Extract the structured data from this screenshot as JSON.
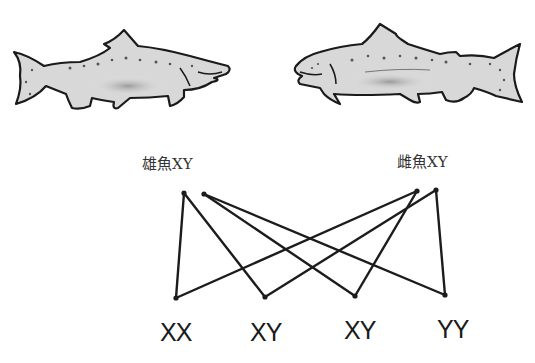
{
  "parents": {
    "male": {
      "label": "雄魚XY",
      "x": 142,
      "y": 152
    },
    "female": {
      "label": "雌魚XY",
      "x": 397,
      "y": 150
    }
  },
  "offspring": [
    {
      "label": "XX",
      "x": 160,
      "y": 318
    },
    {
      "label": "XY",
      "x": 250,
      "y": 318
    },
    {
      "label": "XY",
      "x": 344,
      "y": 316
    },
    {
      "label": "YY",
      "x": 437,
      "y": 315
    }
  ],
  "gamete_points": {
    "male_1": [
      184,
      193
    ],
    "male_2": [
      204,
      194
    ],
    "female_1": [
      417,
      191
    ],
    "female_2": [
      436,
      190
    ]
  },
  "offspring_points": [
    [
      176,
      298
    ],
    [
      265,
      297
    ],
    [
      355,
      296
    ],
    [
      445,
      295
    ]
  ],
  "cross_lines": [
    {
      "from": "male_1",
      "to": 0
    },
    {
      "from": "male_1",
      "to": 1
    },
    {
      "from": "male_2",
      "to": 2
    },
    {
      "from": "male_2",
      "to": 3
    },
    {
      "from": "female_1",
      "to": 0
    },
    {
      "from": "female_1",
      "to": 2
    },
    {
      "from": "female_2",
      "to": 1
    },
    {
      "from": "female_2",
      "to": 3
    }
  ],
  "colors": {
    "line": "#1c1c1c",
    "fish_outline": "#1a1a1a",
    "fish_body": "#c8c8c8",
    "fish_belly": "#e8e8e8"
  }
}
